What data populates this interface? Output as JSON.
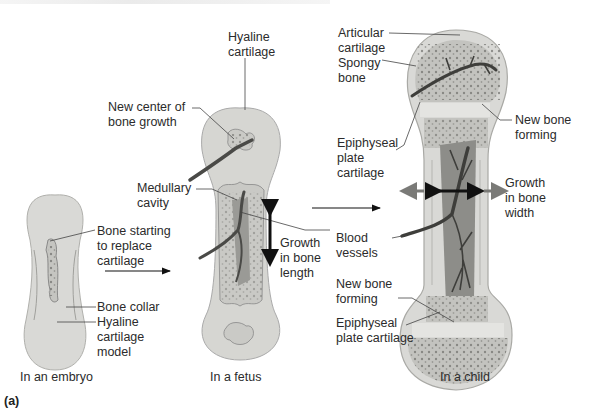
{
  "figure": {
    "panel_label": "(a)",
    "top_caption_visible": "cut off / illegible"
  },
  "stages": [
    {
      "id": "embryo",
      "label": "In an embryo"
    },
    {
      "id": "fetus",
      "label": "In a fetus"
    },
    {
      "id": "child",
      "label": "In a child"
    }
  ],
  "labels": {
    "embryo": {
      "bone_starting": "Bone starting\nto replace\ncartilage",
      "bone_collar": "Bone collar",
      "hyaline_model": "Hyaline\ncartilage\nmodel"
    },
    "fetus": {
      "hyaline_cartilage": "Hyaline\ncartilage",
      "new_center": "New center of\nbone growth",
      "medullary_cavity": "Medullary\ncavity",
      "growth_length": "Growth\nin bone\nlength"
    },
    "child": {
      "articular_cartilage": "Articular\ncartilage",
      "spongy_bone": "Spongy\nbone",
      "new_bone_forming_top": "New bone\nforming",
      "epiphyseal_plate_top": "Epiphyseal\nplate\ncartilage",
      "growth_width": "Growth\nin bone\nwidth",
      "blood_vessels": "Blood\nvessels",
      "new_bone_forming_bottom": "New bone\nforming",
      "epiphyseal_plate_bottom": "Epiphyseal\nplate cartilage"
    }
  },
  "colors": {
    "cartilage": "#d9d9d6",
    "cartilage_edge": "#a9a9a5",
    "bone_shaft": "#c8c8c4",
    "spongy": "#bdbdb9",
    "dots": "#6e6e6a",
    "vessel": "#4a4a47",
    "cavity": "#8d8d89",
    "arrow_dark": "#111111",
    "arrow_gray": "#7a7a77",
    "leader": "#444444"
  }
}
